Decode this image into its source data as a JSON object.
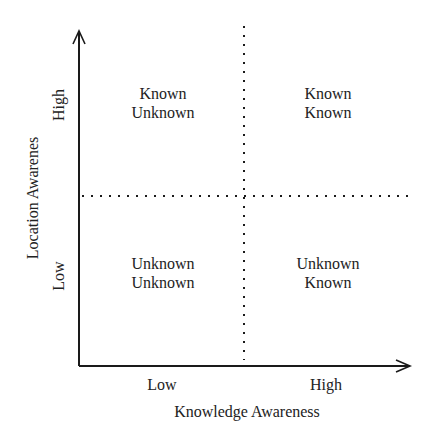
{
  "diagram": {
    "type": "quadrant",
    "x_axis": {
      "title": "Knowledge Awareness",
      "ticks": [
        "Low",
        "High"
      ]
    },
    "y_axis": {
      "title": "Location Awarenes",
      "ticks": [
        "Low",
        "High"
      ]
    },
    "quadrants": {
      "top_left": {
        "line1": "Known",
        "line2": "Unknown"
      },
      "top_right": {
        "line1": "Known",
        "line2": "Known"
      },
      "bottom_left": {
        "line1": "Unknown",
        "line2": "Unknown"
      },
      "bottom_right": {
        "line1": "Unknown",
        "line2": "Known"
      }
    },
    "colors": {
      "axis": "#1a1a1a",
      "text": "#222222",
      "background": "#ffffff"
    }
  }
}
